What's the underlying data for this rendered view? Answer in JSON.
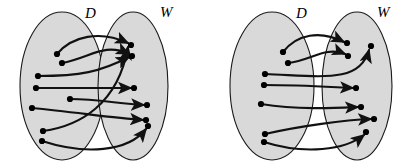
{
  "figure": {
    "title": "",
    "width": 412,
    "height": 166,
    "background_color": "#ffffff",
    "ellipse_fill": "#d9d9d9",
    "ellipse_stroke": "#1a1a1a",
    "edge_color": "#111111",
    "dot_color": "#000000",
    "panels": [
      {
        "id": "left-panel",
        "name": "left-mapping-diagram",
        "sets": [
          {
            "id": "D",
            "label": "D",
            "label_x": 85,
            "label_y": 18,
            "cx": 62,
            "cy": 86,
            "rx": 42,
            "ry": 74
          },
          {
            "id": "W",
            "label": "W",
            "label_x": 160,
            "label_y": 17,
            "cx": 133,
            "cy": 86,
            "rx": 35,
            "ry": 74
          }
        ],
        "domain_nodes": [
          {
            "id": "d1",
            "x": 57,
            "y": 54
          },
          {
            "id": "d2",
            "x": 62,
            "y": 63
          },
          {
            "id": "d3",
            "x": 38,
            "y": 76
          },
          {
            "id": "d4",
            "x": 36,
            "y": 88
          },
          {
            "id": "d5",
            "x": 70,
            "y": 99
          },
          {
            "id": "d6",
            "x": 32,
            "y": 108
          },
          {
            "id": "d7",
            "x": 43,
            "y": 131
          },
          {
            "id": "d8",
            "x": 42,
            "y": 141
          }
        ],
        "codomain_nodes": [
          {
            "id": "w1",
            "x": 131,
            "y": 45
          },
          {
            "id": "w2",
            "x": 132,
            "y": 56
          },
          {
            "id": "w3",
            "x": 134,
            "y": 88
          },
          {
            "id": "w4",
            "x": 147,
            "y": 105
          },
          {
            "id": "w5",
            "x": 146,
            "y": 120
          },
          {
            "id": "w6",
            "x": 148,
            "y": 126
          }
        ],
        "edges": [
          {
            "from": "d1",
            "to": "w1",
            "path": "M 57 54 C 72 36 100 30 128 43"
          },
          {
            "from": "d2",
            "to": "w2",
            "path": "M 62 63 C 90 58 104 42 129 54"
          },
          {
            "from": "d3",
            "to": "w2",
            "path": "M 38 76 C 80 76 100 72 129 57"
          },
          {
            "from": "d4",
            "to": "w3",
            "path": "M 36 88 C 75 88 105 88 131 88"
          },
          {
            "from": "d5",
            "to": "w4",
            "path": "M 70 99 C 98 99 120 104 144 105"
          },
          {
            "from": "d6",
            "to": "w5",
            "path": "M 32 108 C 75 112 112 118 143 120"
          },
          {
            "from": "d7",
            "to": "w1",
            "path": "M 43 131 C 80 126 118 104 128 47"
          },
          {
            "from": "d8",
            "to": "w6",
            "path": "M 42 141 C 85 155 128 152 146 129"
          }
        ]
      },
      {
        "id": "right-panel",
        "name": "right-mapping-diagram",
        "sets": [
          {
            "id": "D",
            "label": "D",
            "label_x": 296,
            "label_y": 18,
            "cx": 272,
            "cy": 86,
            "rx": 42,
            "ry": 74
          },
          {
            "id": "W",
            "label": "W",
            "label_x": 377,
            "label_y": 17,
            "cx": 357,
            "cy": 86,
            "rx": 35,
            "ry": 74
          }
        ],
        "domain_nodes": [
          {
            "id": "e1",
            "x": 283,
            "y": 52
          },
          {
            "id": "e2",
            "x": 288,
            "y": 63
          },
          {
            "id": "e3",
            "x": 265,
            "y": 74
          },
          {
            "id": "e4",
            "x": 264,
            "y": 85
          },
          {
            "id": "e5",
            "x": 261,
            "y": 104
          },
          {
            "id": "e6",
            "x": 265,
            "y": 134
          },
          {
            "id": "e7",
            "x": 264,
            "y": 142
          }
        ],
        "codomain_nodes": [
          {
            "id": "v1",
            "x": 347,
            "y": 43
          },
          {
            "id": "v2",
            "x": 348,
            "y": 56
          },
          {
            "id": "v3",
            "x": 371,
            "y": 46
          },
          {
            "id": "v4",
            "x": 356,
            "y": 88
          },
          {
            "id": "v5",
            "x": 361,
            "y": 107
          },
          {
            "id": "v6",
            "x": 374,
            "y": 119
          },
          {
            "id": "v7",
            "x": 366,
            "y": 132
          }
        ],
        "edges": [
          {
            "from": "e1",
            "to": "v1",
            "path": "M 283 52 C 297 34 320 30 344 42"
          },
          {
            "from": "e2",
            "to": "v2",
            "path": "M 288 63 C 312 60 325 46 345 54"
          },
          {
            "from": "e3",
            "to": "v3",
            "path": "M 265 74 C 320 76 360 84 369 50"
          },
          {
            "from": "e4",
            "to": "v4",
            "path": "M 264 85 C 300 85 330 87 353 88"
          },
          {
            "from": "e5",
            "to": "v5",
            "path": "M 261 104 C 300 110 335 108 358 107"
          },
          {
            "from": "e6",
            "to": "v6",
            "path": "M 265 134 C 300 126 345 120 371 119"
          },
          {
            "from": "e7",
            "to": "v7",
            "path": "M 264 142 C 305 155 345 150 364 135"
          }
        ]
      }
    ]
  }
}
